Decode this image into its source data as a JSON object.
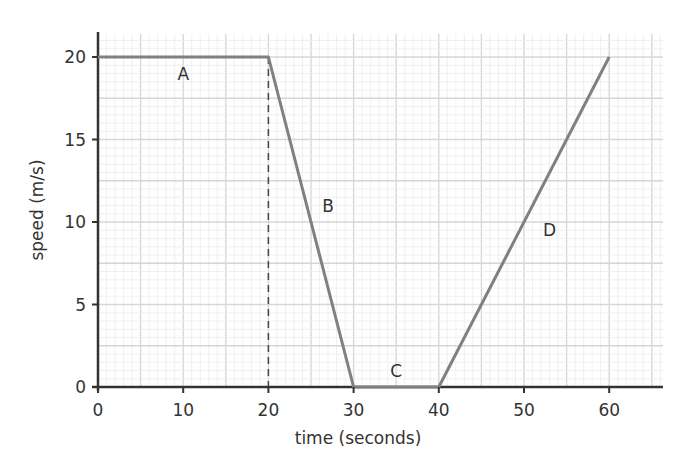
{
  "chart_data": {
    "type": "line",
    "title": "",
    "xlabel": "time (seconds)",
    "ylabel": "speed (m/s)",
    "xlim": [
      0,
      66
    ],
    "ylim": [
      0,
      21.5
    ],
    "x_ticks": [
      0,
      10,
      20,
      30,
      40,
      50,
      60
    ],
    "y_ticks": [
      0,
      5,
      10,
      15,
      20
    ],
    "grid": true,
    "legend": null,
    "series": [
      {
        "name": "speed",
        "x": [
          0,
          20,
          30,
          40,
          60
        ],
        "y": [
          20,
          20,
          0,
          0,
          20
        ],
        "color": "#808080"
      }
    ],
    "annotations": [
      {
        "text": "A",
        "x": 10,
        "y": 19
      },
      {
        "text": "B",
        "x": 27,
        "y": 11
      },
      {
        "text": "C",
        "x": 35,
        "y": 1
      },
      {
        "text": "D",
        "x": 53,
        "y": 9.5
      }
    ],
    "reference_lines": [
      {
        "type": "vertical-dashed",
        "x": 20,
        "from_y": 0,
        "to_y": 20
      }
    ]
  },
  "labels": {
    "xlabel": "time (seconds)",
    "ylabel": "speed (m/s)",
    "x_ticks": [
      "0",
      "10",
      "20",
      "30",
      "40",
      "50",
      "60"
    ],
    "y_ticks": [
      "0",
      "5",
      "10",
      "15",
      "20"
    ],
    "seg": [
      "A",
      "B",
      "C",
      "D"
    ]
  }
}
